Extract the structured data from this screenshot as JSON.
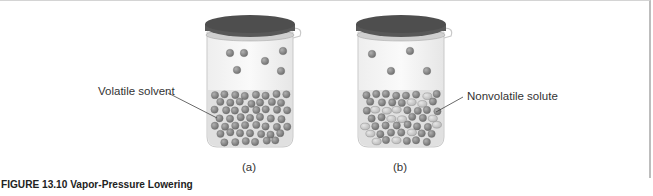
{
  "figure": {
    "caption": "FIGURE 13.10 Vapor-Pressure Lowering",
    "panels": [
      {
        "id": "a",
        "label": "(a)",
        "callout": "Volatile solvent",
        "description": "Pure volatile solvent in closed container; more solvent molecules in vapor phase"
      },
      {
        "id": "b",
        "label": "(b)",
        "callout": "Nonvolatile solute",
        "description": "Solution with nonvolatile solute; fewer solvent molecules in vapor phase"
      }
    ],
    "colors": {
      "solvent_particle": "#8a8a8a",
      "solute_particle": "#c8c8c8",
      "lid": "#555555",
      "liquid": "#e2e2e2"
    }
  }
}
